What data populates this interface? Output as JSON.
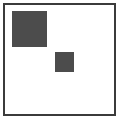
{
  "canvas": {
    "width_px": 121,
    "height_px": 121,
    "background_color": "#ffffff"
  },
  "frame": {
    "name": "outer-frame",
    "border_color": "#3b3b3b",
    "border_width_px": 2,
    "fill_color": "#ffffff",
    "x": 3,
    "y": 3,
    "width": 113,
    "height": 113
  },
  "shapes": [
    {
      "name": "large-square",
      "type": "square",
      "fill_color": "#4c4c4c",
      "x": 12,
      "y": 11,
      "width": 35,
      "height": 36,
      "position_label": "upper-left"
    },
    {
      "name": "small-square",
      "type": "square",
      "fill_color": "#4c4c4c",
      "x": 55,
      "y": 52,
      "width": 19,
      "height": 20,
      "position_label": "center"
    }
  ]
}
